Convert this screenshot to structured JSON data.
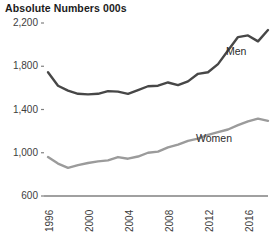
{
  "chart_data": {
    "type": "line",
    "title": "Absolute Numbers 000s",
    "xlabel": "",
    "ylabel": "",
    "ylim": [
      600,
      2200
    ],
    "xlim": [
      1996,
      2018
    ],
    "grid": false,
    "legend_position": "inline-right",
    "y_ticks": [
      "600",
      "1,000",
      "1,400",
      "1,800",
      "2,200"
    ],
    "y_tick_values": [
      600,
      1000,
      1400,
      1800,
      2200
    ],
    "x_ticks": [
      "1996",
      "2000",
      "2004",
      "2008",
      "2012",
      "2016"
    ],
    "x_tick_values": [
      1996,
      2000,
      2004,
      2008,
      2012,
      2016
    ],
    "x": [
      1996,
      1997,
      1998,
      1999,
      2000,
      2001,
      2002,
      2003,
      2004,
      2005,
      2006,
      2007,
      2008,
      2009,
      2010,
      2011,
      2012,
      2013,
      2014,
      2015,
      2016,
      2017,
      2018
    ],
    "series": [
      {
        "name": "Men",
        "color": "#474747",
        "values": [
          1745,
          1620,
          1575,
          1545,
          1540,
          1545,
          1570,
          1565,
          1545,
          1580,
          1615,
          1620,
          1650,
          1625,
          1660,
          1730,
          1745,
          1820,
          1945,
          2070,
          2085,
          2030,
          2135
        ]
      },
      {
        "name": "Women",
        "color": "#9b9b9b",
        "values": [
          960,
          900,
          860,
          885,
          905,
          920,
          930,
          960,
          945,
          965,
          1000,
          1010,
          1050,
          1075,
          1110,
          1130,
          1165,
          1190,
          1215,
          1255,
          1290,
          1315,
          1295
        ]
      }
    ],
    "annotations": [
      {
        "text": "Men",
        "x": 2016,
        "y": 1935
      },
      {
        "text": "Women",
        "x": 2013,
        "y": 1125
      }
    ],
    "axis_color": "#808080",
    "tick_color": "#808080",
    "text_color": "#3d3d3d"
  }
}
